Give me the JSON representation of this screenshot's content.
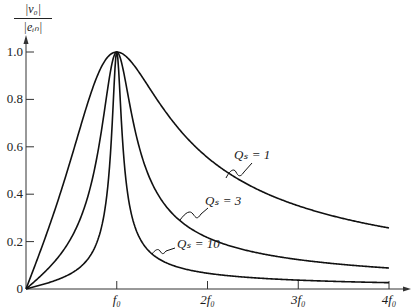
{
  "chart_data": {
    "type": "line",
    "title": "",
    "xlabel": "",
    "ylabel": "|v_o| / |e_in|",
    "y_label_num": "|v₀|",
    "y_label_den": "|eᵢₙ|",
    "xlim": [
      0,
      4
    ],
    "ylim": [
      0,
      1.0
    ],
    "grid": false,
    "legend_position": "inline annotations",
    "x_ticks": [
      {
        "value": 1,
        "label": "f₀"
      },
      {
        "value": 2,
        "label": "2f₀"
      },
      {
        "value": 3,
        "label": "3f₀"
      },
      {
        "value": 4,
        "label": "4f₀"
      }
    ],
    "y_ticks": [
      {
        "value": 0,
        "label": "0"
      },
      {
        "value": 0.2,
        "label": "0.2"
      },
      {
        "value": 0.4,
        "label": "0.4"
      },
      {
        "value": 0.6,
        "label": "0.6"
      },
      {
        "value": 0.8,
        "label": "0.8"
      },
      {
        "value": 1.0,
        "label": "1.0"
      }
    ],
    "x": [
      0,
      0.25,
      0.5,
      0.75,
      1.0,
      1.25,
      1.5,
      2.0,
      2.5,
      3.0,
      3.5,
      4.0
    ],
    "series": [
      {
        "name": "Qs = 1",
        "label": "Qₛ = 1",
        "values": [
          0,
          0.258,
          0.555,
          0.864,
          1.0,
          0.912,
          0.768,
          0.555,
          0.43,
          0.351,
          0.297,
          0.258
        ]
      },
      {
        "name": "Qs = 3",
        "label": "Qₛ = 3",
        "values": [
          0,
          0.088,
          0.217,
          0.496,
          1.0,
          0.595,
          0.371,
          0.217,
          0.157,
          0.124,
          0.103,
          0.088
        ]
      },
      {
        "name": "Qs = 10",
        "label": "Qₛ = 10",
        "values": [
          0,
          0.027,
          0.066,
          0.169,
          1.0,
          0.217,
          0.119,
          0.066,
          0.048,
          0.037,
          0.031,
          0.027
        ]
      }
    ],
    "annotations": [
      {
        "text": "Qₛ = 1",
        "x": 234,
        "y": 156
      },
      {
        "text": "Qₛ = 3",
        "x": 205,
        "y": 202
      },
      {
        "text": "Qₛ = 10",
        "x": 177,
        "y": 245
      }
    ]
  }
}
